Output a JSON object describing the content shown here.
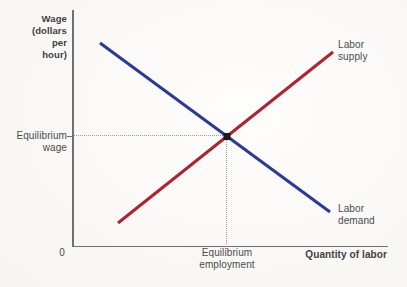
{
  "figure": {
    "wage_axis_label": [
      "Wage",
      "(dollars",
      "per",
      "hour)"
    ],
    "x_axis_title": "Quantity of labor",
    "origin_label": "0",
    "equilibrium_wage_label": [
      "Equilibrium",
      "wage"
    ],
    "equilibrium_employment_label": [
      "Equilibrium",
      "employment"
    ],
    "supply_label": [
      "Labor",
      "supply"
    ],
    "demand_label": [
      "Labor",
      "demand"
    ],
    "colors": {
      "supply_line": "#b02230",
      "demand_line": "#2b3a94",
      "axis": "#6e6f71",
      "text": "#4b4b4d",
      "text_bold": "#3f3f41",
      "dotted_guide": "#9b9b9b",
      "equilibrium_point": "#1b1b1b",
      "background": "#fbfaf7"
    },
    "geometry": {
      "demand_line": {
        "x1": 100,
        "y1": 43,
        "x2": 330,
        "y2": 212
      },
      "supply_line": {
        "x1": 118,
        "y1": 223,
        "x2": 333,
        "y2": 52
      },
      "equilibrium_point": {
        "x": 227,
        "y": 136.5,
        "size": 7
      },
      "stroke_width": 3
    }
  },
  "chart_data": {
    "type": "line",
    "title": "",
    "xlabel": "Quantity of labor",
    "ylabel": "Wage (dollars per hour)",
    "numeric_axes": false,
    "series": [
      {
        "name": "Labor supply",
        "color": "#b02230",
        "trend": "upward-sloping",
        "points_frac": [
          [
            0.14,
            0.1
          ],
          [
            0.83,
            0.82
          ]
        ]
      },
      {
        "name": "Labor demand",
        "color": "#2b3a94",
        "trend": "downward-sloping",
        "points_frac": [
          [
            0.09,
            0.86
          ],
          [
            0.82,
            0.14
          ]
        ]
      }
    ],
    "equilibrium_frac": [
      0.49,
      0.46
    ],
    "annotations": [
      "Equilibrium wage",
      "Equilibrium employment"
    ],
    "legend": "inline-labels"
  }
}
